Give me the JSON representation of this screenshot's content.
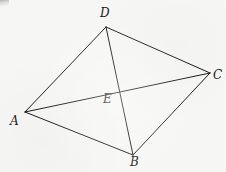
{
  "figure": {
    "type": "geometry-diagram",
    "canvas": {
      "width": 226,
      "height": 172
    },
    "background_color": "#f6f6f4",
    "stroke_color": "#1a1a1a",
    "stroke_width": 1
  },
  "points": {
    "A": {
      "label": "A",
      "x": 25,
      "y": 112,
      "label_x": 10,
      "label_y": 115
    },
    "B": {
      "label": "B",
      "x": 133,
      "y": 155,
      "label_x": 130,
      "label_y": 156
    },
    "C": {
      "label": "C",
      "x": 210,
      "y": 73,
      "label_x": 213,
      "label_y": 69
    },
    "D": {
      "label": "D",
      "x": 106,
      "y": 27,
      "label_x": 100,
      "label_y": 7
    },
    "E": {
      "label": "E",
      "x": 117,
      "y": 88,
      "label_x": 103,
      "label_y": 93
    }
  },
  "segments": [
    {
      "name": "side-AD",
      "from": "A",
      "to": "D"
    },
    {
      "name": "side-DC",
      "from": "D",
      "to": "C"
    },
    {
      "name": "side-CB",
      "from": "C",
      "to": "B"
    },
    {
      "name": "side-BA",
      "from": "B",
      "to": "A"
    },
    {
      "name": "diagonal-AC",
      "from": "A",
      "to": "C"
    },
    {
      "name": "diagonal-DB",
      "from": "D",
      "to": "B"
    }
  ]
}
